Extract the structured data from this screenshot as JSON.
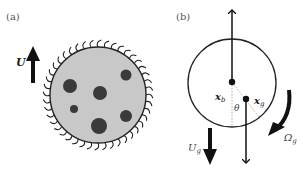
{
  "panels": {
    "a": {
      "label": "(a)",
      "velocity_label": "U",
      "cell_fill": "#c8c8c8",
      "inclusion_color": "#3a3a3a",
      "inclusion_count": 6
    },
    "b": {
      "label": "(b)",
      "xb_label": "x",
      "xb_sub": "b",
      "xg_label": "x",
      "xg_sub": "g",
      "theta_label": "θ",
      "Ug_label": "U",
      "Ug_sub": "g",
      "Omega_label": "Ω",
      "Omega_sub": "g"
    }
  }
}
